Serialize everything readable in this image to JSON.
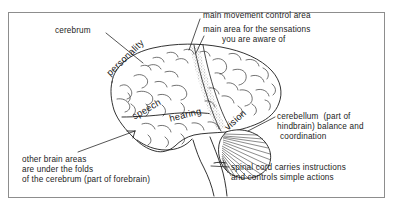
{
  "figure": {
    "type": "labelled-anatomical-diagram",
    "frame_border_color": "#8d8d8d",
    "background_color": "#ffffff",
    "ink_color": "#1c1c1c"
  },
  "callouts": {
    "cerebrum": "cerebrum",
    "motor_area": "main movement control area",
    "sensory_area_line1": "main area for the sensations",
    "sensory_area_line2": "you are aware of",
    "cerebellum_line1": "cerebellum  (part of",
    "cerebellum_line2": "hindbrain) balance and",
    "cerebellum_line3": "coordination",
    "spinal_cord_line1": "spinal cord carries instructions",
    "spinal_cord_line2": "and controls simple actions",
    "other_areas_line1": "other brain areas",
    "other_areas_line2": "are under the folds",
    "other_areas_line3": "of the cerebrum (part of forebrain)"
  },
  "regions": {
    "personality": "personality",
    "speech": "speech",
    "hearing": "hearing",
    "vision": "vision"
  }
}
